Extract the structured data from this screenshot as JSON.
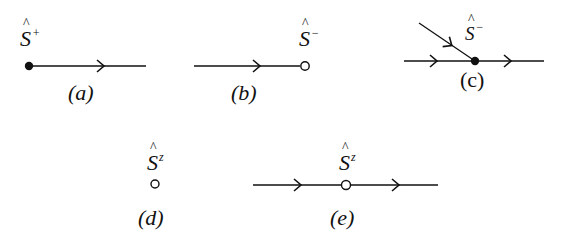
{
  "diagram": {
    "title": "",
    "stroke_color": "#111111",
    "background": "#ffffff",
    "panels": [
      {
        "id": "a",
        "caption": "(a)",
        "operator": {
          "symbol": "S",
          "hat": true,
          "superscript": "+"
        },
        "vertex": "filled",
        "lines": [
          {
            "from": "vertex",
            "direction": "outgoing-right",
            "arrow": "right"
          }
        ]
      },
      {
        "id": "b",
        "caption": "(b)",
        "operator": {
          "symbol": "S",
          "hat": true,
          "superscript": "−"
        },
        "vertex": "open",
        "lines": [
          {
            "to": "vertex",
            "direction": "incoming-from-left",
            "arrow": "right"
          }
        ]
      },
      {
        "id": "c",
        "caption": "(c)",
        "operator": {
          "symbol": "S",
          "hat": true,
          "superscript": "−"
        },
        "vertex": "filled",
        "lines": [
          {
            "direction": "incoming-from-left",
            "arrow": "right"
          },
          {
            "direction": "outgoing-right",
            "arrow": "right"
          },
          {
            "direction": "incoming-diagonal-from-upper-left",
            "arrow": "down-right"
          }
        ]
      },
      {
        "id": "d",
        "caption": "(d)",
        "operator": {
          "symbol": "S",
          "hat": true,
          "superscript": "z"
        },
        "vertex": "open",
        "lines": []
      },
      {
        "id": "e",
        "caption": "(e)",
        "operator": {
          "symbol": "S",
          "hat": true,
          "superscript": "z"
        },
        "vertex": "open",
        "lines": [
          {
            "direction": "incoming-from-left",
            "arrow": "right"
          },
          {
            "direction": "outgoing-right",
            "arrow": "right"
          }
        ]
      }
    ]
  },
  "labels": {
    "a": {
      "symbol": "S",
      "sup": "+",
      "caption": "(a)"
    },
    "b": {
      "symbol": "S",
      "sup": "−",
      "caption": "(b)"
    },
    "c": {
      "symbol": "S",
      "sup": "−",
      "caption": "(c)"
    },
    "d": {
      "symbol": "S",
      "sup": "z",
      "caption": "(d)"
    },
    "e": {
      "symbol": "S",
      "sup": "z",
      "caption": "(e)"
    }
  }
}
